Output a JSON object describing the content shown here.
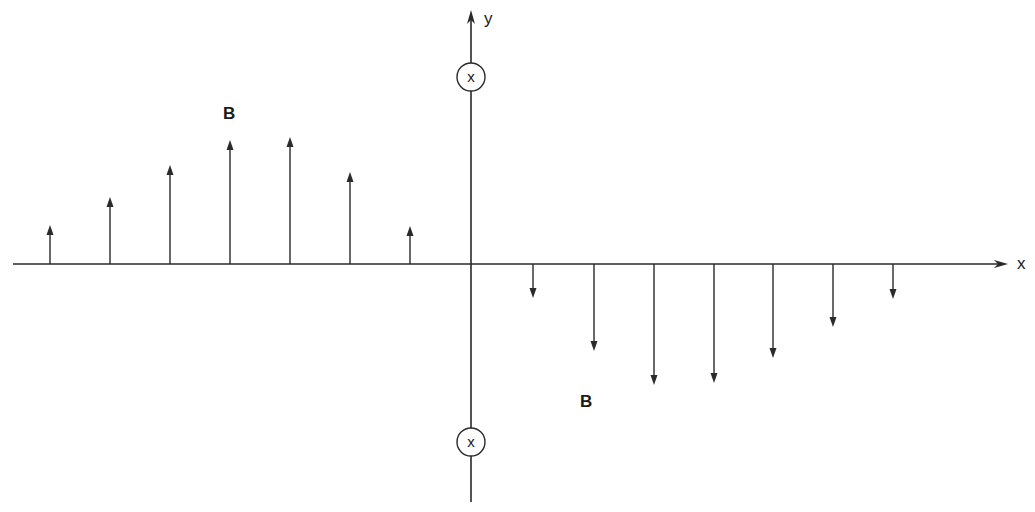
{
  "diagram": {
    "colors": {
      "line": "#2a2a2a",
      "background": "#ffffff"
    },
    "x_axis": {
      "label": "x",
      "y": 264,
      "x_start": 13,
      "x_end": 1008
    },
    "y_axis": {
      "label": "y",
      "x": 471,
      "y_start": 502,
      "y_end": 10
    },
    "wires": [
      {
        "symbol": "x",
        "meaning": "current into page",
        "cx": 471,
        "cy": 77
      },
      {
        "symbol": "x",
        "meaning": "current into page",
        "cx": 471,
        "cy": 442
      }
    ],
    "field_labels": [
      {
        "text": "B",
        "x": 223,
        "y": 119
      },
      {
        "text": "B",
        "x": 580,
        "y": 407
      }
    ],
    "up_arrows": [
      {
        "x": 50,
        "tip": 225
      },
      {
        "x": 110,
        "tip": 197
      },
      {
        "x": 170,
        "tip": 165
      },
      {
        "x": 230,
        "tip": 140
      },
      {
        "x": 290,
        "tip": 137
      },
      {
        "x": 350,
        "tip": 172
      },
      {
        "x": 410,
        "tip": 226
      }
    ],
    "down_arrows": [
      {
        "x": 533,
        "tip": 298
      },
      {
        "x": 594,
        "tip": 351
      },
      {
        "x": 654,
        "tip": 385
      },
      {
        "x": 714,
        "tip": 383
      },
      {
        "x": 773,
        "tip": 358
      },
      {
        "x": 833,
        "tip": 327
      },
      {
        "x": 893,
        "tip": 299
      }
    ]
  }
}
